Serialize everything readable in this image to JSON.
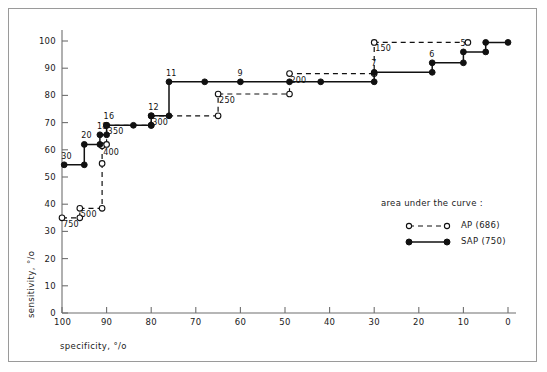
{
  "axes": {
    "xlabel": "specificity, °/o",
    "ylabel": "sensitivity, °/o",
    "xticks": [
      "100",
      "90",
      "80",
      "70",
      "60",
      "50",
      "40",
      "30",
      "20",
      "10",
      "0"
    ],
    "yticks": [
      "0",
      "10",
      "20",
      "30",
      "40",
      "50",
      "60",
      "70",
      "80",
      "90",
      "100"
    ]
  },
  "legend": {
    "title": "area under the curve :",
    "entries": [
      {
        "symbol": "open-circle-dashed",
        "label": "AP  (686)"
      },
      {
        "symbol": "filled-circle-solid",
        "label": "SAP (750)"
      }
    ]
  },
  "chart_data": {
    "type": "line",
    "title": "",
    "xlabel": "specificity, °/o",
    "ylabel": "sensitivity, °/o",
    "xlim": [
      100,
      0
    ],
    "xreversed": true,
    "ylim": [
      0,
      105
    ],
    "grid": false,
    "legend_position": "right-lower",
    "series": [
      {
        "name": "AP",
        "auc": 686,
        "marker": "open-circle",
        "linestyle": "dashed",
        "points": [
          {
            "x": 100,
            "y": 35,
            "label": "750"
          },
          {
            "x": 96,
            "y": 35,
            "label": ""
          },
          {
            "x": 96,
            "y": 38.5,
            "label": "500"
          },
          {
            "x": 91,
            "y": 38.5,
            "label": ""
          },
          {
            "x": 91,
            "y": 55,
            "label": ""
          },
          {
            "x": 91,
            "y": 61.5,
            "label": "400"
          },
          {
            "x": 90,
            "y": 62,
            "label": ""
          },
          {
            "x": 90,
            "y": 69,
            "label": "350"
          },
          {
            "x": 80,
            "y": 69,
            "label": ""
          },
          {
            "x": 80,
            "y": 72.5,
            "label": "300"
          },
          {
            "x": 65,
            "y": 72.5,
            "label": ""
          },
          {
            "x": 65,
            "y": 80.5,
            "label": "250"
          },
          {
            "x": 49,
            "y": 80.5,
            "label": ""
          },
          {
            "x": 49,
            "y": 88,
            "label": "200"
          },
          {
            "x": 30,
            "y": 88,
            "label": ""
          },
          {
            "x": 30,
            "y": 99.5,
            "label": "150"
          },
          {
            "x": 9,
            "y": 99.5,
            "label": ""
          }
        ]
      },
      {
        "name": "SAP",
        "auc": 750,
        "marker": "filled-circle",
        "linestyle": "solid",
        "points": [
          {
            "x": 99.5,
            "y": 54.5,
            "label": "30"
          },
          {
            "x": 95,
            "y": 54.5,
            "label": ""
          },
          {
            "x": 95,
            "y": 62,
            "label": "20"
          },
          {
            "x": 91.5,
            "y": 62,
            "label": ""
          },
          {
            "x": 91.5,
            "y": 65.5,
            "label": "18"
          },
          {
            "x": 90,
            "y": 65.5,
            "label": ""
          },
          {
            "x": 90,
            "y": 69,
            "label": "16"
          },
          {
            "x": 84,
            "y": 69,
            "label": ""
          },
          {
            "x": 80,
            "y": 69,
            "label": ""
          },
          {
            "x": 80,
            "y": 72.5,
            "label": "12"
          },
          {
            "x": 76,
            "y": 72.5,
            "label": ""
          },
          {
            "x": 76,
            "y": 85,
            "label": "11"
          },
          {
            "x": 68,
            "y": 85,
            "label": ""
          },
          {
            "x": 60,
            "y": 85,
            "label": "9"
          },
          {
            "x": 49,
            "y": 85,
            "label": ""
          },
          {
            "x": 42,
            "y": 85,
            "label": ""
          },
          {
            "x": 30,
            "y": 85,
            "label": ""
          },
          {
            "x": 30,
            "y": 88.5,
            "label": "7"
          },
          {
            "x": 17,
            "y": 88.5,
            "label": ""
          },
          {
            "x": 17,
            "y": 92,
            "label": "6"
          },
          {
            "x": 10,
            "y": 92,
            "label": ""
          },
          {
            "x": 10,
            "y": 96,
            "label": "5"
          },
          {
            "x": 5,
            "y": 96,
            "label": ""
          },
          {
            "x": 5,
            "y": 99.5,
            "label": ""
          },
          {
            "x": 0,
            "y": 99.5,
            "label": ""
          }
        ]
      }
    ]
  }
}
